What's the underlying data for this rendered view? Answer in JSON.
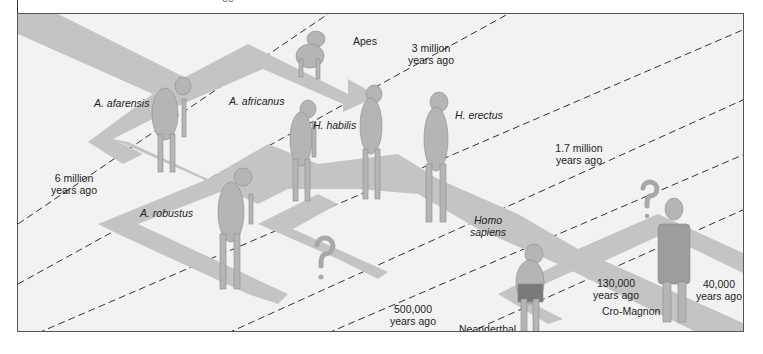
{
  "diagram": {
    "top_fragment": "ee",
    "species": [
      {
        "id": "apes",
        "label": "Apes",
        "italic": false
      },
      {
        "id": "a-afarensis",
        "label": "A. afarensis",
        "italic": true
      },
      {
        "id": "a-africanus",
        "label": "A. africanus",
        "italic": true
      },
      {
        "id": "h-habilis",
        "label": "H. habilis",
        "italic": true
      },
      {
        "id": "h-erectus",
        "label": "H. erectus",
        "italic": true
      },
      {
        "id": "a-robustus",
        "label": "A. robustus",
        "italic": true
      },
      {
        "id": "homo-sapiens",
        "label_line1": "Homo",
        "label_line2": "sapiens",
        "italic": true
      },
      {
        "id": "neanderthal",
        "label": "Neanderthal",
        "italic": false
      },
      {
        "id": "cro-magnon",
        "label": "Cro-Magnon",
        "italic": false
      }
    ],
    "time_markers": [
      {
        "line1": "6 million",
        "line2": "years ago"
      },
      {
        "line1": "3 million",
        "line2": "years ago"
      },
      {
        "line1": "1.7 million",
        "line2": "years ago"
      },
      {
        "line1": "500,000",
        "line2": "years ago"
      },
      {
        "line1": "130,000",
        "line2": "years ago"
      },
      {
        "line1": "40,000",
        "line2": "years ago"
      }
    ],
    "unknown_markers": [
      "?",
      "?"
    ],
    "colors": {
      "background": "#f2f2f2",
      "path": "#c4c4c4",
      "path_light": "#dadada",
      "figure": "#b5b5b5",
      "dashed_line": "#333333",
      "question_mark": "#a8a8a8"
    }
  }
}
